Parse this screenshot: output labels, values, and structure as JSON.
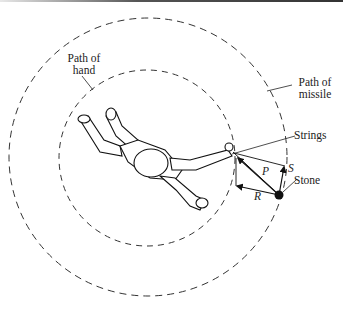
{
  "figure": {
    "labels": {
      "path_of_hand": [
        "Path of",
        "hand"
      ],
      "path_of_missile": [
        "Path of",
        "missile"
      ],
      "strings": "Strings",
      "stone": "Stone",
      "force_p": "P",
      "force_s": "S",
      "force_r": "R"
    },
    "colors": {
      "line": "#222222",
      "dash": "#333333",
      "background": "#ffffff"
    },
    "elements": [
      "outer dashed circle (path of missile)",
      "inner dashed circle (path of hand)",
      "figure of a person seen from above swinging a sling",
      "stone at end of strings",
      "force vector parallelogram P, S, R"
    ]
  }
}
